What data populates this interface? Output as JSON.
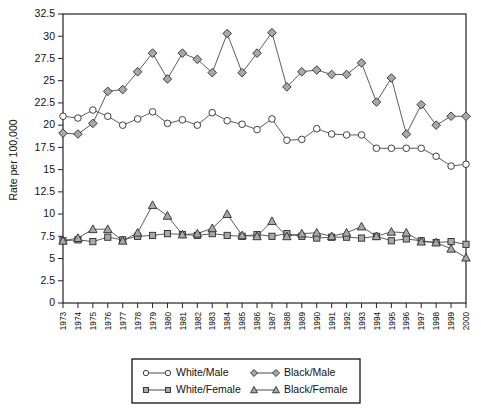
{
  "chart_data": {
    "type": "line",
    "title": "",
    "xlabel": "Year of Diagnosis",
    "ylabel": "Rate per 100,000",
    "xlim": [
      1973,
      2000
    ],
    "ylim": [
      0,
      32.5
    ],
    "ytick_labels": [
      "0",
      "2.5",
      "5",
      "7.5",
      "10",
      "12.5",
      "15",
      "17.5",
      "20",
      "22.5",
      "25",
      "27.5",
      "30",
      "32.5"
    ],
    "ytick_values": [
      0,
      2.5,
      5,
      7.5,
      10,
      12.5,
      15,
      17.5,
      20,
      22.5,
      25,
      27.5,
      30,
      32.5
    ],
    "grid": false,
    "legend_position": "bottom-center",
    "x": [
      1973,
      1974,
      1975,
      1976,
      1977,
      1978,
      1979,
      1980,
      1981,
      1982,
      1983,
      1984,
      1985,
      1986,
      1987,
      1988,
      1989,
      1990,
      1991,
      1992,
      1993,
      1994,
      1995,
      1996,
      1997,
      1998,
      1999,
      2000
    ],
    "categories": [
      "1973",
      "1974",
      "1975",
      "1976",
      "1977",
      "1978",
      "1979",
      "1980",
      "1981",
      "1982",
      "1983",
      "1984",
      "1985",
      "1986",
      "1987",
      "1988",
      "1989",
      "1990",
      "1991",
      "1992",
      "1993",
      "1994",
      "1995",
      "1996",
      "1997",
      "1998",
      "1999",
      "2000"
    ],
    "series": [
      {
        "name": "White/Male",
        "marker": "circle-open",
        "values": [
          21.0,
          20.8,
          21.7,
          21.0,
          20.0,
          20.7,
          21.5,
          20.2,
          20.6,
          20.0,
          21.4,
          20.5,
          20.1,
          19.5,
          20.7,
          18.3,
          18.4,
          19.6,
          19.0,
          18.9,
          18.9,
          17.4,
          17.4,
          17.4,
          17.4,
          16.5,
          15.4,
          15.6
        ]
      },
      {
        "name": "White/Female",
        "marker": "square-fill",
        "values": [
          7.0,
          7.1,
          6.9,
          7.4,
          7.1,
          7.5,
          7.6,
          7.8,
          7.7,
          7.6,
          7.8,
          7.6,
          7.5,
          7.7,
          7.5,
          7.8,
          7.5,
          7.3,
          7.4,
          7.4,
          7.3,
          7.5,
          7.0,
          7.2,
          7.0,
          6.8,
          6.9,
          6.6
        ]
      },
      {
        "name": "Black/Male",
        "marker": "diamond-fill",
        "values": [
          19.1,
          19.0,
          20.2,
          23.8,
          24.0,
          26.0,
          28.1,
          25.2,
          28.1,
          27.4,
          25.9,
          30.3,
          25.9,
          28.1,
          30.4,
          24.3,
          26.0,
          26.2,
          25.7,
          25.7,
          27.0,
          22.6,
          25.3,
          19.0,
          22.3,
          20.0,
          21.0,
          21.0
        ]
      },
      {
        "name": "Black/Female",
        "marker": "triangle-fill",
        "values": [
          7.0,
          7.3,
          8.3,
          8.3,
          7.0,
          7.9,
          11.0,
          9.8,
          7.7,
          7.8,
          8.4,
          10.0,
          7.6,
          7.5,
          9.2,
          7.5,
          7.8,
          7.9,
          7.5,
          7.9,
          8.6,
          7.5,
          8.0,
          7.9,
          6.9,
          6.8,
          6.1,
          5.1
        ]
      }
    ]
  },
  "legend": {
    "entries": [
      {
        "label": "White/Male",
        "marker": "circle-open"
      },
      {
        "label": "Black/Male",
        "marker": "diamond-fill"
      },
      {
        "label": "White/Female",
        "marker": "square-fill"
      },
      {
        "label": "Black/Female",
        "marker": "triangle-fill"
      }
    ]
  },
  "colors": {
    "line": "#4a4a4a",
    "marker_stroke": "#2b2b2b",
    "marker_fill": "#a8a8a8",
    "marker_open": "#ffffff",
    "axis": "#222222",
    "background": "#ffffff"
  }
}
